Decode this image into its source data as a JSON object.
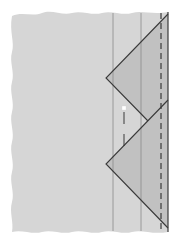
{
  "diagram": {
    "type": "fold-diagram",
    "colors": {
      "background": "#ffffff",
      "sheet": "#d6d6d6",
      "fold_shade": "#bdbdbd",
      "line": "#3a3a3a",
      "thin_line": "#8a8a8a",
      "marker": "#ffffff"
    },
    "sheet": {
      "left": 10,
      "right": 168,
      "top": 13,
      "bottom": 232,
      "wavy_edges": [
        "top",
        "left",
        "bottom"
      ]
    },
    "vertical_lines": [
      {
        "x": 113,
        "style": "thin"
      },
      {
        "x": 141,
        "style": "thin"
      },
      {
        "x": 161,
        "style": "dashed"
      },
      {
        "x": 168,
        "style": "solid"
      }
    ],
    "triangles": [
      {
        "name": "upper-fold",
        "points": [
          [
            106,
            78
          ],
          [
            168,
            14
          ],
          [
            168,
            100
          ],
          [
            148,
            121
          ]
        ]
      },
      {
        "name": "lower-fold",
        "points": [
          [
            106,
            164
          ],
          [
            168,
            100
          ],
          [
            168,
            228
          ]
        ]
      }
    ],
    "marker": {
      "x": 124,
      "y": 108,
      "size": 4
    },
    "marker_line": {
      "x": 124,
      "y1": 112,
      "y2": 155,
      "style": "dashed"
    }
  }
}
